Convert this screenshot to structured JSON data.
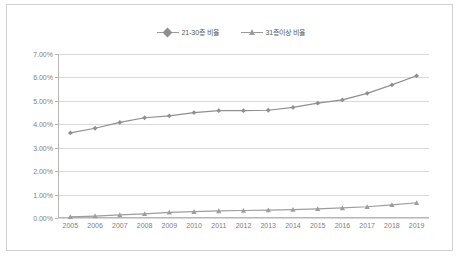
{
  "chart_data": {
    "type": "line",
    "title": "",
    "subtitle": "",
    "xlabel": "",
    "ylabel": "",
    "grid": true,
    "legend_position": "top-center",
    "x": [
      2005,
      2006,
      2007,
      2008,
      2009,
      2010,
      2011,
      2012,
      2013,
      2014,
      2015,
      2016,
      2017,
      2018,
      2019
    ],
    "categories": [
      "2005",
      "2006",
      "2007",
      "2008",
      "2009",
      "2010",
      "2011",
      "2012",
      "2013",
      "2014",
      "2015",
      "2016",
      "2017",
      "2018",
      "2019"
    ],
    "ylim": [
      0,
      7
    ],
    "ytick_labels": [
      "0.00%",
      "1.00%",
      "2.00%",
      "3.00%",
      "4.00%",
      "5.00%",
      "6.00%",
      "7.00%"
    ],
    "ytick_values": [
      0,
      1,
      2,
      3,
      4,
      5,
      6,
      7
    ],
    "series": [
      {
        "name": "21-30층 비율",
        "marker": "diamond",
        "color": "#8f8f8f",
        "values": [
          3.63,
          3.83,
          4.08,
          4.28,
          4.36,
          4.5,
          4.58,
          4.58,
          4.6,
          4.72,
          4.9,
          5.04,
          5.32,
          5.68,
          6.07
        ]
      },
      {
        "name": "31층이상 비율",
        "marker": "triangle",
        "color": "#9d9d9d",
        "values": [
          0.05,
          0.08,
          0.13,
          0.18,
          0.24,
          0.27,
          0.3,
          0.32,
          0.34,
          0.36,
          0.39,
          0.43,
          0.48,
          0.56,
          0.65
        ]
      }
    ]
  },
  "legend": {
    "entries": [
      {
        "label": "21-30층 비율",
        "marker": "diamond-marker"
      },
      {
        "label": "31층이상 비율",
        "marker": "triangle-marker"
      }
    ]
  },
  "colors": {
    "series_1": "#8f8f8f",
    "series_2": "#9d9d9d",
    "gridline": "#d9d9d9",
    "axis": "#b6b6b6",
    "tick_text": "#808080",
    "frame_border": "#d2d2d2"
  }
}
